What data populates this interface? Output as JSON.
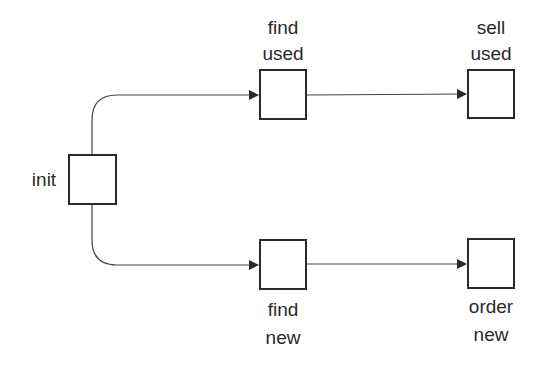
{
  "diagram": {
    "type": "flow",
    "colors": {
      "stroke": "#2a2a2a",
      "background": "#ffffff"
    },
    "nodes": [
      {
        "id": "init",
        "label": "init"
      },
      {
        "id": "find_used",
        "label_line1": "find",
        "label_line2": "used"
      },
      {
        "id": "sell_used",
        "label_line1": "sell",
        "label_line2": "used"
      },
      {
        "id": "find_new",
        "label_line1": "find",
        "label_line2": "new"
      },
      {
        "id": "order_new",
        "label_line1": "order",
        "label_line2": "new"
      }
    ],
    "edges": [
      {
        "from": "init",
        "to": "find_used"
      },
      {
        "from": "init",
        "to": "find_new"
      },
      {
        "from": "find_used",
        "to": "sell_used"
      },
      {
        "from": "find_new",
        "to": "order_new"
      }
    ]
  }
}
